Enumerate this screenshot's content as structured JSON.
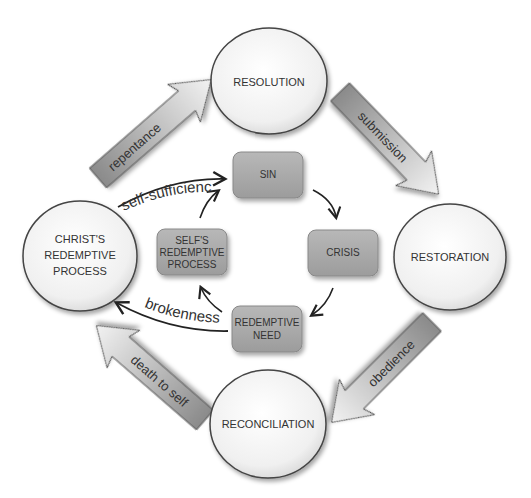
{
  "diagram": {
    "outer_nodes": {
      "resolution": "RESOLUTION",
      "restoration": "RESTORATION",
      "reconciliation": "RECONCILIATION",
      "christ_line1": "CHRIST'S",
      "christ_line2": "REDEMPTIVE",
      "christ_line3": "PROCESS"
    },
    "outer_arrows": {
      "repentance": "repentance",
      "submission": "submission",
      "obedience": "obedience",
      "death_to_self": "death to self"
    },
    "inner_nodes": {
      "sin": "SIN",
      "crisis": "CRISIS",
      "redemptive_need_line1": "REDEMPTIVE",
      "redemptive_need_line2": "NEED",
      "self_line1": "SELF'S",
      "self_line2": "REDEMPTIVE",
      "self_line3": "PROCESS"
    },
    "curve_labels": {
      "self_sufficiency": "self-sufficiency",
      "brokenness": "brokenness"
    },
    "colors": {
      "circle_fill": "#f4f4f4",
      "circle_stroke": "#444444",
      "box_fill": "#a9a9a9",
      "arrow_fill": "#9a9a9a",
      "text": "#333333"
    }
  }
}
